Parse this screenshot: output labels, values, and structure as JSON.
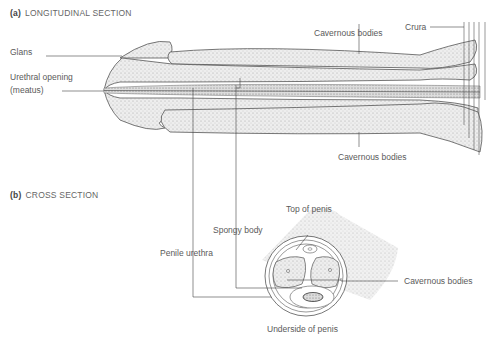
{
  "sections": {
    "a": {
      "tag": "(a)",
      "title": "LONGITUDINAL SECTION"
    },
    "b": {
      "tag": "(b)",
      "title": "CROSS SECTION"
    }
  },
  "labels": {
    "glans": "Glans",
    "urethral_opening": "Urethral opening",
    "meatus": "(meatus)",
    "cavernous_top": "Cavernous bodies",
    "crura": "Crura",
    "cavernous_bottom": "Cavernous bodies",
    "top_of_penis": "Top of penis",
    "spongy_body": "Spongy body",
    "penile_urethra": "Penile urethra",
    "cavernous_cross": "Cavernous bodies",
    "underside": "Underside of penis"
  },
  "colors": {
    "stipple": "#d9d9d9",
    "outline": "#555555",
    "line": "#444444"
  }
}
